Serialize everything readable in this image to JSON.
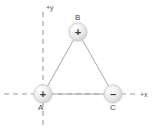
{
  "figure": {
    "type": "physics-diagram",
    "background_color": "#ffffff",
    "width": 160,
    "height": 134
  },
  "axes": {
    "origin": {
      "x": 43,
      "y": 94
    },
    "style": "dashed",
    "color": "#9a9a9a",
    "x_axis": {
      "label": "+x",
      "label_x": 140,
      "label_y": 91,
      "from_x": 4,
      "to_x": 137,
      "y": 94
    },
    "y_axis": {
      "label": "+y",
      "label_x": 46,
      "label_y": 4,
      "from_y": 12,
      "to_y": 128,
      "x": 43
    }
  },
  "charges": [
    {
      "id": "A",
      "label": "A",
      "sign": "+",
      "sign_glyph": "+",
      "cx": 43,
      "cy": 94,
      "r": 9,
      "label_x": 38,
      "label_y": 104,
      "fill": "#e4e4e4"
    },
    {
      "id": "B",
      "label": "B",
      "sign": "+",
      "sign_glyph": "+",
      "cx": 78,
      "cy": 32,
      "r": 9,
      "label_x": 75,
      "label_y": 14,
      "fill": "#e4e4e4"
    },
    {
      "id": "C",
      "label": "C",
      "sign": "-",
      "sign_glyph": "–",
      "cx": 113,
      "cy": 94,
      "r": 9,
      "label_x": 110,
      "label_y": 104,
      "fill": "#e4e4e4"
    }
  ],
  "edges": [
    {
      "name": "edge-a-b",
      "from": "A",
      "to": "B",
      "x1": 43,
      "y1": 94,
      "x2": 78,
      "y2": 32
    },
    {
      "name": "edge-b-c",
      "from": "B",
      "to": "C",
      "x1": 78,
      "y1": 32,
      "x2": 113,
      "y2": 94
    },
    {
      "name": "edge-a-c",
      "from": "A",
      "to": "C",
      "x1": 43,
      "y1": 94,
      "x2": 113,
      "y2": 94
    }
  ],
  "style": {
    "edge_color": "#9e9e9e",
    "sphere_highlight": "#fdfdfd",
    "sphere_mid": "#ededed",
    "sphere_edge": "#c9c9c9",
    "sign_color": "#3a3a3a"
  }
}
